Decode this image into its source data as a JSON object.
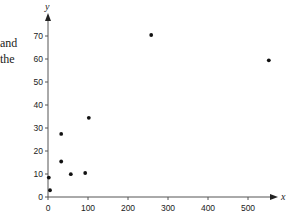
{
  "side_text": [
    "and",
    "the"
  ],
  "chart_data": {
    "type": "scatter",
    "title": "",
    "xlabel": "x",
    "ylabel": "y",
    "xlim": [
      0,
      560
    ],
    "ylim": [
      0,
      78
    ],
    "xticks": [
      0,
      100,
      200,
      300,
      400,
      500
    ],
    "yticks": [
      0,
      10,
      20,
      30,
      40,
      50,
      60,
      70
    ],
    "grid": false,
    "legend": null,
    "points": [
      {
        "x": 2,
        "y": 8
      },
      {
        "x": 5,
        "y": 2.5
      },
      {
        "x": 33,
        "y": 27
      },
      {
        "x": 33,
        "y": 15
      },
      {
        "x": 57,
        "y": 9.5
      },
      {
        "x": 93,
        "y": 10
      },
      {
        "x": 102,
        "y": 34
      },
      {
        "x": 258,
        "y": 70
      },
      {
        "x": 552,
        "y": 59
      }
    ],
    "marker_color": "#111111",
    "axis_color": "#555555"
  }
}
